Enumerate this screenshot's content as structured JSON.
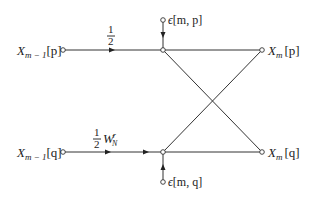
{
  "diagram": {
    "type": "butterfly-flow-graph",
    "inputs": {
      "top": {
        "var": "X",
        "sub": "m − 1",
        "idx": "[p]"
      },
      "bottom": {
        "var": "X",
        "sub": "m − 1",
        "idx": "[q]"
      }
    },
    "outputs": {
      "top": {
        "var": "X",
        "sub": "m",
        "idx": "[p]"
      },
      "bottom": {
        "var": "X",
        "sub": "m",
        "idx": "[q]"
      }
    },
    "gains": {
      "top": {
        "num": "1",
        "den": "2",
        "factor": ""
      },
      "bottom": {
        "num": "1",
        "den": "2",
        "factor": "W",
        "factor_sub": "N",
        "factor_sup": "r"
      }
    },
    "noise": {
      "top": {
        "sym": "ϵ",
        "args": "[m, p]"
      },
      "bottom": {
        "sym": "ϵ",
        "args": "[m, q]"
      }
    },
    "colors": {
      "line": "#333333",
      "text": "#222222",
      "background": "#ffffff"
    }
  }
}
